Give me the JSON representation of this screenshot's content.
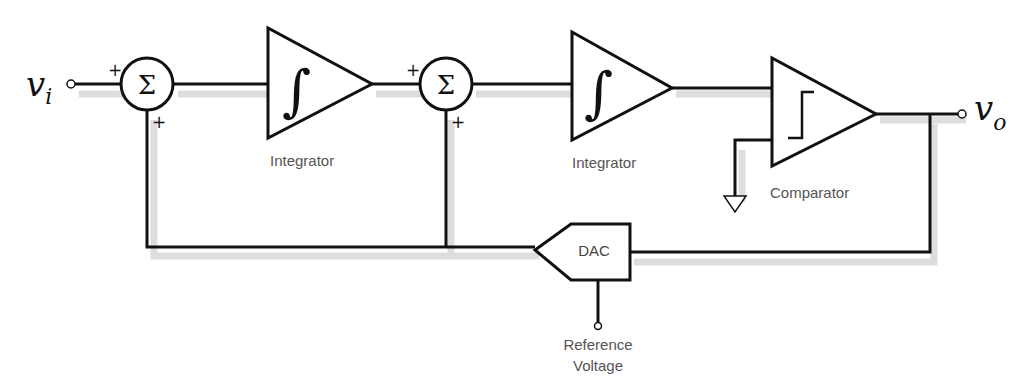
{
  "diagram": {
    "input": {
      "symbol": "v",
      "subscript": "i"
    },
    "output": {
      "symbol": "v",
      "subscript": "o"
    },
    "summers": [
      {
        "glyph": "Σ",
        "sign_left": "+",
        "sign_bottom": "+"
      },
      {
        "glyph": "Σ",
        "sign_left": "+",
        "sign_bottom": "+"
      }
    ],
    "blocks": [
      {
        "type": "integrator",
        "glyph": "∫",
        "label": "Integrator"
      },
      {
        "type": "integrator",
        "glyph": "∫",
        "label": "Integrator"
      },
      {
        "type": "comparator",
        "label": "Comparator"
      }
    ],
    "dac": {
      "label": "DAC",
      "reference_label_line1": "Reference",
      "reference_label_line2": "Voltage"
    },
    "colors": {
      "line": "#111111",
      "label": "#555555",
      "shadow": "#cfcfcf"
    }
  }
}
